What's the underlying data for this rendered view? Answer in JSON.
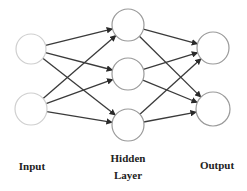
{
  "diagram": {
    "colors": {
      "background": "#ffffff",
      "input_node_stroke": "#cfcfcf",
      "node_stroke": "#9a9a9a",
      "edge": "#3a3a3a",
      "label": "#222222"
    },
    "layers": [
      {
        "id": "input",
        "label": "Input",
        "label_lines": [
          "Input"
        ],
        "nodes": [
          {
            "id": "i1",
            "cx": 31,
            "cy": 49,
            "r": 15
          },
          {
            "id": "i2",
            "cx": 31,
            "cy": 109,
            "r": 16
          }
        ]
      },
      {
        "id": "hidden",
        "label": "Hidden Layer",
        "label_lines": [
          "Hidden",
          "Layer"
        ],
        "nodes": [
          {
            "id": "h1",
            "cx": 128,
            "cy": 25,
            "r": 16
          },
          {
            "id": "h2",
            "cx": 128,
            "cy": 74,
            "r": 16
          },
          {
            "id": "h3",
            "cx": 128,
            "cy": 125,
            "r": 16
          }
        ]
      },
      {
        "id": "output",
        "label": "Output",
        "label_lines": [
          "Output"
        ],
        "nodes": [
          {
            "id": "o1",
            "cx": 213,
            "cy": 48,
            "r": 16
          },
          {
            "id": "o2",
            "cx": 213,
            "cy": 109,
            "r": 17
          }
        ]
      }
    ],
    "edges": [
      {
        "from": "i1",
        "to": "h1"
      },
      {
        "from": "i1",
        "to": "h2"
      },
      {
        "from": "i1",
        "to": "h3"
      },
      {
        "from": "i2",
        "to": "h1"
      },
      {
        "from": "i2",
        "to": "h2"
      },
      {
        "from": "i2",
        "to": "h3"
      },
      {
        "from": "h1",
        "to": "o1"
      },
      {
        "from": "h1",
        "to": "o2"
      },
      {
        "from": "h2",
        "to": "o1"
      },
      {
        "from": "h2",
        "to": "o2"
      },
      {
        "from": "h3",
        "to": "o1"
      },
      {
        "from": "h3",
        "to": "o2"
      }
    ],
    "labels": {
      "input": "Input",
      "hidden_line1": "Hidden",
      "hidden_line2": "Layer",
      "output": "Output"
    }
  }
}
